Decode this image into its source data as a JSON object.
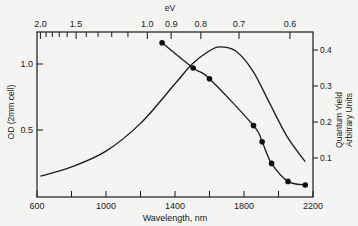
{
  "chart_data": {
    "type": "line",
    "title": "",
    "xlabel": "Wavelength, nm",
    "x_top_label": "eV",
    "ylabel_left": "OD (2mm cell)",
    "ylabel_right_line1": "Quantum  Yield",
    "ylabel_right_line2": "Arbitrary Units",
    "xlim": [
      600,
      2200
    ],
    "ylim_left": [
      0,
      1.25
    ],
    "ylim_right": [
      0,
      0.45
    ],
    "x_ticks": [
      600,
      800,
      1000,
      1200,
      1400,
      1600,
      1800,
      2000,
      2200
    ],
    "x_tick_labels": [
      "600",
      "1000",
      "1400",
      "1800",
      "2200"
    ],
    "x_top_ticks": [
      {
        "label": "2.0",
        "ev": 2.0
      },
      {
        "label": "1.5",
        "ev": 1.5
      },
      {
        "label": "1.0",
        "ev": 1.0
      },
      {
        "label": "0.9",
        "ev": 0.9
      },
      {
        "label": "0.8",
        "ev": 0.8
      },
      {
        "label": "0.7",
        "ev": 0.7
      },
      {
        "label": "0.6",
        "ev": 0.6
      }
    ],
    "y_left_ticks": [
      {
        "label": "1.0",
        "value": 1.0
      },
      {
        "label": "0.5",
        "value": 0.5
      }
    ],
    "y_right_ticks": [
      {
        "label": "0.4",
        "value": 0.4
      },
      {
        "label": "0.3",
        "value": 0.3
      },
      {
        "label": "0.2",
        "value": 0.2
      },
      {
        "label": "0.1",
        "value": 0.1
      }
    ],
    "grid": false,
    "legend": null,
    "series": [
      {
        "name": "OD (2mm cell)",
        "axis": "left",
        "style": "smooth line",
        "x": [
          620,
          800,
          1000,
          1200,
          1400,
          1500,
          1600,
          1660,
          1750,
          1850,
          1950,
          2050,
          2155
        ],
        "y": [
          0.15,
          0.22,
          0.34,
          0.55,
          0.85,
          1.0,
          1.1,
          1.13,
          1.1,
          0.95,
          0.7,
          0.45,
          0.26
        ]
      },
      {
        "name": "Quantum Yield",
        "axis": "right",
        "style": "line with filled circle markers",
        "x": [
          1325,
          1505,
          1600,
          1855,
          1905,
          1960,
          2055,
          2155
        ],
        "y": [
          0.42,
          0.35,
          0.32,
          0.19,
          0.145,
          0.085,
          0.035,
          0.025
        ]
      }
    ]
  }
}
